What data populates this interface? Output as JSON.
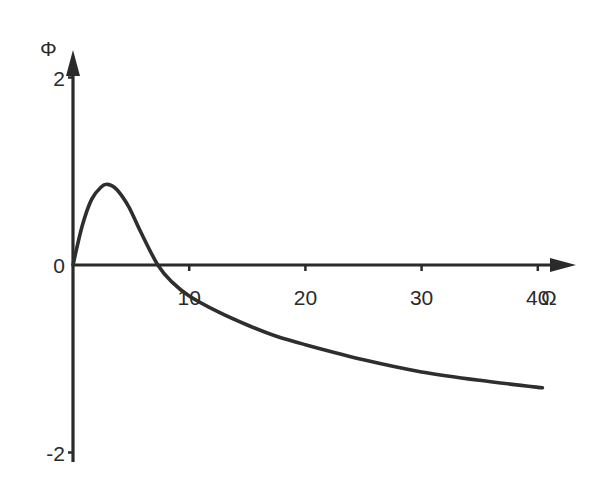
{
  "chart_data": {
    "type": "line",
    "title": "",
    "xlabel": "Ω",
    "ylabel": "Φ",
    "xlim": [
      0,
      43
    ],
    "ylim": [
      -2,
      2.2
    ],
    "grid": false,
    "legend": "none",
    "x_ticks": [
      {
        "value": 10,
        "label": "10"
      },
      {
        "value": 20,
        "label": "20"
      },
      {
        "value": 30,
        "label": "30"
      },
      {
        "value": 40,
        "label": "40"
      }
    ],
    "y_ticks": [
      {
        "value": 2,
        "label": "2"
      },
      {
        "value": 0,
        "label": "0"
      },
      {
        "value": -2,
        "label": "-2"
      }
    ],
    "series": [
      {
        "name": "Φ(Ω)",
        "color": "#2e2e2e",
        "x": [
          0,
          0.8,
          1.6,
          2.4,
          3.0,
          3.8,
          4.8,
          5.8,
          7.3,
          8.5,
          10,
          12.5,
          15,
          17.5,
          20,
          25,
          30,
          35,
          40.4
        ],
        "y": [
          0,
          0.42,
          0.7,
          0.83,
          0.86,
          0.8,
          0.62,
          0.36,
          0.0,
          -0.18,
          -0.33,
          -0.5,
          -0.64,
          -0.76,
          -0.85,
          -1.01,
          -1.14,
          -1.23,
          -1.31
        ]
      }
    ]
  }
}
